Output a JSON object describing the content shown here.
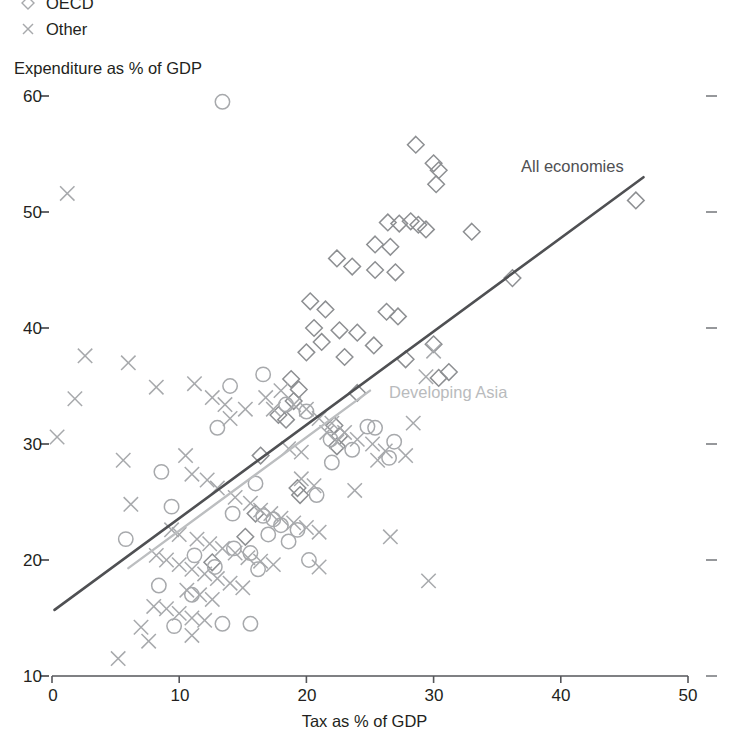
{
  "legend": {
    "items": [
      {
        "label": "OECD",
        "marker": "diamond-icon"
      },
      {
        "label": "Other",
        "marker": "cross-icon"
      }
    ]
  },
  "axes": {
    "y_title": "Expenditure as % of GDP",
    "x_title": "Tax as % of GDP",
    "y_ticks": [
      "60",
      "50",
      "40",
      "30",
      "20",
      "10"
    ],
    "x_ticks": [
      "0",
      "10",
      "20",
      "30",
      "40",
      "50"
    ]
  },
  "annotations": {
    "all_economies": "All economies",
    "developing_asia": "Developing Asia"
  },
  "colors": {
    "all_economies_line": "#4f5053",
    "developing_asia_line": "#bcbec0",
    "marker": "#a7a9ac",
    "axis": "#55565a",
    "text": "#231f20"
  },
  "chart_data": {
    "type": "scatter",
    "title": "",
    "xlabel": "Tax as % of GDP",
    "ylabel": "Expenditure as % of GDP",
    "xlim": [
      0,
      50
    ],
    "ylim": [
      10,
      60
    ],
    "xticks": [
      0,
      10,
      20,
      30,
      40,
      50
    ],
    "yticks": [
      10,
      20,
      30,
      40,
      50,
      60
    ],
    "grid": false,
    "legend_position": "top-left",
    "series": [
      {
        "name": "OECD",
        "marker": "diamond",
        "points": [
          [
            28.6,
            55.8
          ],
          [
            30.0,
            54.2
          ],
          [
            30.4,
            53.6
          ],
          [
            30.2,
            52.4
          ],
          [
            26.4,
            49.1
          ],
          [
            27.3,
            49.0
          ],
          [
            28.2,
            49.2
          ],
          [
            28.8,
            48.9
          ],
          [
            29.4,
            48.5
          ],
          [
            33.0,
            48.3
          ],
          [
            25.4,
            47.2
          ],
          [
            26.6,
            47.0
          ],
          [
            22.4,
            46.0
          ],
          [
            23.6,
            45.3
          ],
          [
            25.4,
            45.0
          ],
          [
            27.0,
            44.8
          ],
          [
            36.2,
            44.3
          ],
          [
            20.3,
            42.3
          ],
          [
            21.5,
            41.6
          ],
          [
            26.3,
            41.4
          ],
          [
            27.2,
            41.0
          ],
          [
            20.6,
            40.0
          ],
          [
            22.6,
            39.8
          ],
          [
            24.0,
            39.6
          ],
          [
            21.2,
            38.8
          ],
          [
            25.3,
            38.5
          ],
          [
            20.0,
            37.9
          ],
          [
            23.0,
            37.5
          ],
          [
            27.8,
            37.3
          ],
          [
            30.0,
            38.6
          ],
          [
            31.2,
            36.2
          ],
          [
            30.4,
            35.7
          ],
          [
            18.8,
            35.6
          ],
          [
            19.4,
            34.7
          ],
          [
            19.0,
            33.7
          ],
          [
            24.0,
            34.4
          ],
          [
            17.8,
            32.5
          ],
          [
            18.4,
            32.1
          ],
          [
            22.2,
            31.6
          ],
          [
            22.6,
            30.7
          ],
          [
            22.4,
            29.8
          ],
          [
            45.9,
            51.0
          ],
          [
            19.3,
            26.2
          ],
          [
            19.5,
            25.6
          ],
          [
            16.4,
            29.0
          ],
          [
            16.0,
            24.0
          ],
          [
            15.2,
            22.0
          ],
          [
            12.6,
            19.8
          ]
        ]
      },
      {
        "name": "Other-circle",
        "marker": "circle",
        "points": [
          [
            13.4,
            59.5
          ],
          [
            16.6,
            36.0
          ],
          [
            14.0,
            35.0
          ],
          [
            18.4,
            33.4
          ],
          [
            20.0,
            32.8
          ],
          [
            13.0,
            31.4
          ],
          [
            24.8,
            31.5
          ],
          [
            25.4,
            31.4
          ],
          [
            8.6,
            27.6
          ],
          [
            21.9,
            30.4
          ],
          [
            23.6,
            29.5
          ],
          [
            22.0,
            28.4
          ],
          [
            26.9,
            30.2
          ],
          [
            26.5,
            28.8
          ],
          [
            9.4,
            24.6
          ],
          [
            20.8,
            25.6
          ],
          [
            16.0,
            26.6
          ],
          [
            5.8,
            21.8
          ],
          [
            14.2,
            24.0
          ],
          [
            16.6,
            23.8
          ],
          [
            17.4,
            23.5
          ],
          [
            18.0,
            23.0
          ],
          [
            17.0,
            22.2
          ],
          [
            18.6,
            21.6
          ],
          [
            19.3,
            22.6
          ],
          [
            20.2,
            20.0
          ],
          [
            14.3,
            21.0
          ],
          [
            15.6,
            20.6
          ],
          [
            11.2,
            20.4
          ],
          [
            12.8,
            19.4
          ],
          [
            16.2,
            19.2
          ],
          [
            8.4,
            17.8
          ],
          [
            11.0,
            17.0
          ],
          [
            13.4,
            14.5
          ],
          [
            15.6,
            14.5
          ],
          [
            9.6,
            14.3
          ]
        ]
      },
      {
        "name": "Other",
        "marker": "cross",
        "points": [
          [
            1.2,
            51.6
          ],
          [
            2.6,
            37.6
          ],
          [
            6.0,
            37.0
          ],
          [
            1.8,
            33.9
          ],
          [
            8.2,
            34.9
          ],
          [
            11.2,
            35.2
          ],
          [
            0.4,
            30.6
          ],
          [
            5.6,
            28.6
          ],
          [
            12.6,
            34.0
          ],
          [
            13.6,
            33.4
          ],
          [
            14.0,
            32.2
          ],
          [
            15.2,
            33.0
          ],
          [
            16.8,
            34.0
          ],
          [
            17.4,
            33.0
          ],
          [
            18.0,
            34.6
          ],
          [
            19.0,
            33.4
          ],
          [
            20.0,
            33.0
          ],
          [
            21.0,
            32.2
          ],
          [
            22.0,
            31.8
          ],
          [
            23.0,
            31.0
          ],
          [
            24.0,
            30.4
          ],
          [
            25.2,
            30.0
          ],
          [
            26.2,
            29.4
          ],
          [
            27.8,
            29.0
          ],
          [
            30.0,
            38.0
          ],
          [
            29.4,
            35.8
          ],
          [
            21.6,
            31.0
          ],
          [
            22.4,
            30.2
          ],
          [
            18.6,
            29.6
          ],
          [
            19.6,
            29.3
          ],
          [
            6.2,
            24.8
          ],
          [
            10.5,
            29.0
          ],
          [
            11.0,
            27.4
          ],
          [
            12.2,
            26.9
          ],
          [
            13.0,
            26.2
          ],
          [
            14.4,
            25.4
          ],
          [
            15.6,
            24.9
          ],
          [
            16.4,
            24.3
          ],
          [
            17.2,
            24.0
          ],
          [
            18.0,
            23.6
          ],
          [
            19.0,
            23.2
          ],
          [
            20.0,
            22.8
          ],
          [
            21.0,
            22.4
          ],
          [
            9.4,
            22.6
          ],
          [
            10.0,
            22.2
          ],
          [
            11.4,
            21.8
          ],
          [
            12.4,
            21.4
          ],
          [
            13.4,
            21.0
          ],
          [
            14.4,
            20.6
          ],
          [
            15.4,
            20.2
          ],
          [
            16.4,
            19.9
          ],
          [
            17.4,
            19.6
          ],
          [
            8.2,
            20.4
          ],
          [
            9.0,
            20.0
          ],
          [
            10.0,
            19.6
          ],
          [
            11.0,
            19.2
          ],
          [
            12.0,
            18.8
          ],
          [
            13.0,
            18.4
          ],
          [
            14.0,
            18.0
          ],
          [
            15.0,
            17.6
          ],
          [
            10.6,
            17.4
          ],
          [
            11.6,
            17.0
          ],
          [
            12.6,
            16.6
          ],
          [
            8.0,
            16.0
          ],
          [
            9.0,
            15.8
          ],
          [
            10.0,
            15.4
          ],
          [
            11.0,
            15.0
          ],
          [
            12.0,
            14.8
          ],
          [
            21.0,
            19.4
          ],
          [
            29.6,
            18.2
          ],
          [
            25.6,
            28.6
          ],
          [
            28.4,
            31.8
          ],
          [
            5.2,
            11.5
          ],
          [
            7.6,
            13.0
          ],
          [
            11.0,
            13.5
          ],
          [
            7.0,
            14.2
          ],
          [
            26.6,
            22.0
          ],
          [
            23.8,
            26.0
          ],
          [
            19.6,
            27.0
          ],
          [
            20.6,
            26.4
          ]
        ]
      }
    ],
    "trendlines": [
      {
        "name": "All economies",
        "color": "#4f5053",
        "x": [
          0.2,
          46.5
        ],
        "y": [
          15.7,
          53.0
        ]
      },
      {
        "name": "Developing Asia",
        "color": "#bcbec0",
        "x": [
          6.0,
          25.0
        ],
        "y": [
          19.3,
          34.6
        ]
      }
    ]
  }
}
